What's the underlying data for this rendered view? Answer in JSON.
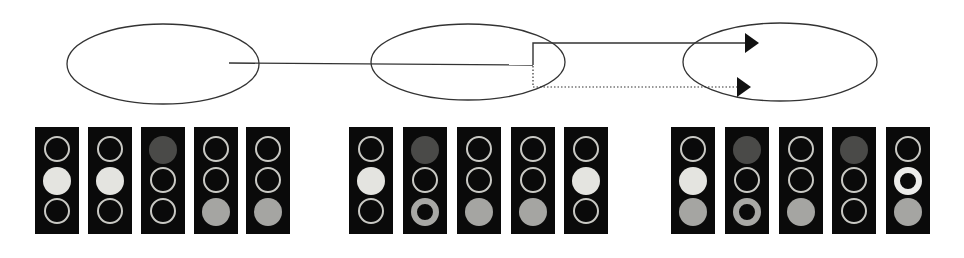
{
  "diagram": {
    "colors": {
      "line": "#333333",
      "panel_bg": "#0a0a0a",
      "ring": "#c9c9c4",
      "bright": "#e4e4e0",
      "gray": "#a5a5a2",
      "dark": "#4a4a48"
    },
    "ellipses": [
      {
        "id": "state-1",
        "cx": 163,
        "cy": 64,
        "rx": 96,
        "ry": 40
      },
      {
        "id": "state-2",
        "cx": 468,
        "cy": 62,
        "rx": 97,
        "ry": 38
      },
      {
        "id": "state-3",
        "cx": 780,
        "cy": 62,
        "rx": 97,
        "ry": 39
      }
    ],
    "connectors": [
      {
        "style": "solid",
        "points": [
          [
            229,
            63
          ],
          [
            533,
            65
          ]
        ],
        "arrow": false
      },
      {
        "style": "solid",
        "points": [
          [
            533,
            65
          ],
          [
            533,
            43
          ],
          [
            745,
            43
          ]
        ],
        "arrow": true
      },
      {
        "style": "dotted",
        "points": [
          [
            533,
            66
          ],
          [
            533,
            87
          ],
          [
            737,
            87
          ]
        ],
        "arrow": true
      }
    ],
    "groups": [
      {
        "name": "group-1",
        "panels": [
          {
            "x": 35,
            "lamps": [
              "ring",
              "bright",
              "ring"
            ]
          },
          {
            "x": 88,
            "lamps": [
              "ring",
              "bright",
              "ring"
            ]
          },
          {
            "x": 141,
            "lamps": [
              "dark",
              "ring",
              "ring"
            ]
          },
          {
            "x": 194,
            "lamps": [
              "ring",
              "ring",
              "gray"
            ]
          },
          {
            "x": 246,
            "lamps": [
              "ring",
              "ring",
              "gray"
            ]
          }
        ]
      },
      {
        "name": "group-2",
        "panels": [
          {
            "x": 349,
            "lamps": [
              "ring",
              "bright",
              "ring"
            ]
          },
          {
            "x": 403,
            "lamps": [
              "dark",
              "ring",
              "thick-ring-gray"
            ]
          },
          {
            "x": 457,
            "lamps": [
              "ring",
              "ring",
              "gray"
            ]
          },
          {
            "x": 511,
            "lamps": [
              "ring",
              "ring",
              "gray"
            ]
          },
          {
            "x": 564,
            "lamps": [
              "ring",
              "bright",
              "ring"
            ]
          }
        ]
      },
      {
        "name": "group-3",
        "panels": [
          {
            "x": 671,
            "lamps": [
              "ring",
              "bright",
              "gray"
            ]
          },
          {
            "x": 725,
            "lamps": [
              "dark",
              "ring",
              "thick-ring-gray"
            ]
          },
          {
            "x": 779,
            "lamps": [
              "ring",
              "ring",
              "gray"
            ]
          },
          {
            "x": 832,
            "lamps": [
              "dark",
              "ring",
              "ring"
            ]
          },
          {
            "x": 886,
            "lamps": [
              "ring",
              "thick-ring-bright",
              "gray"
            ]
          }
        ]
      }
    ],
    "panel_top": 127
  }
}
